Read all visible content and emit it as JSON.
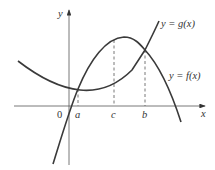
{
  "diagram": {
    "type": "function-graph",
    "axes": {
      "x_label": "x",
      "y_label": "y",
      "origin_label": "0"
    },
    "curves": [
      {
        "name": "g",
        "label": "y = g(x)",
        "shape": "concave-down parabola rising steeply through origin region"
      },
      {
        "name": "f",
        "label": "y = f(x)",
        "shape": "concave-up parabola with minimum near a"
      }
    ],
    "points": [
      {
        "label": "a",
        "meaning": "left intersection of f and g"
      },
      {
        "label": "c",
        "meaning": "point between a and b, dashed vertical line to g"
      },
      {
        "label": "b",
        "meaning": "right intersection of f and g"
      }
    ],
    "colors": {
      "curve": "#3a3a3a",
      "axis": "#555555",
      "background": "#ffffff"
    }
  }
}
